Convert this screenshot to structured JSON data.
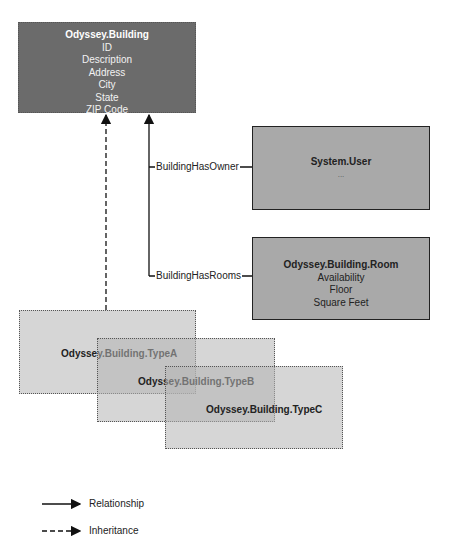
{
  "entities": {
    "building": {
      "title": "Odyssey.Building",
      "fields": [
        "ID",
        "Description",
        "Address",
        "City",
        "State",
        "ZIP Code"
      ]
    },
    "user": {
      "title": "System.User",
      "fields": [
        "..."
      ]
    },
    "room": {
      "title": "Odyssey.Building.Room",
      "fields": [
        "Availability",
        "Floor",
        "Square Feet"
      ]
    },
    "typeA": {
      "title": "Odyssey.Building.TypeA"
    },
    "typeB": {
      "title": "Odyssey.Building.TypeB"
    },
    "typeC": {
      "title": "Odyssey.Building.TypeC"
    }
  },
  "relationships": {
    "owner": "BuildingHasOwner",
    "rooms": "BuildingHasRooms"
  },
  "legend": {
    "relationship": "Relationship",
    "inheritance": "Inheritance"
  }
}
